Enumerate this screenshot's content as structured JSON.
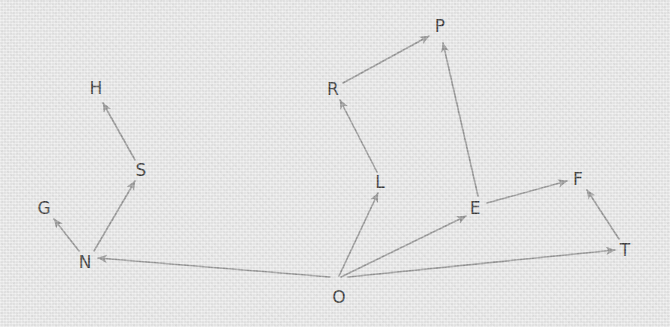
{
  "diagram": {
    "type": "directed-graph",
    "background_color": "#ececec",
    "edge_color": "#8a8a8a",
    "label_color": "#1c1c1c",
    "width": 670,
    "height": 327,
    "nodes": [
      {
        "id": "H",
        "label": "H",
        "x": 96,
        "y": 88
      },
      {
        "id": "S",
        "label": "S",
        "x": 141,
        "y": 170
      },
      {
        "id": "G",
        "label": "G",
        "x": 44,
        "y": 208
      },
      {
        "id": "N",
        "label": "N",
        "x": 85,
        "y": 262
      },
      {
        "id": "P",
        "label": "P",
        "x": 440,
        "y": 26
      },
      {
        "id": "R",
        "label": "R",
        "x": 333,
        "y": 89
      },
      {
        "id": "L",
        "label": "L",
        "x": 380,
        "y": 182
      },
      {
        "id": "E",
        "label": "E",
        "x": 475,
        "y": 208
      },
      {
        "id": "F",
        "label": "F",
        "x": 578,
        "y": 179
      },
      {
        "id": "T",
        "label": "T",
        "x": 625,
        "y": 250
      },
      {
        "id": "O",
        "label": "O",
        "x": 339,
        "y": 297
      }
    ],
    "edges": [
      {
        "from": "S",
        "to": "H",
        "x1": 135,
        "y1": 160,
        "x2": 103,
        "y2": 103
      },
      {
        "from": "N",
        "to": "S",
        "x1": 94,
        "y1": 251,
        "x2": 135,
        "y2": 181
      },
      {
        "from": "N",
        "to": "G",
        "x1": 79,
        "y1": 251,
        "x2": 54,
        "y2": 219
      },
      {
        "from": "O",
        "to": "N",
        "x1": 330,
        "y1": 277,
        "x2": 98,
        "y2": 258
      },
      {
        "from": "O",
        "to": "L",
        "x1": 339,
        "y1": 276,
        "x2": 378,
        "y2": 193
      },
      {
        "from": "O",
        "to": "E",
        "x1": 341,
        "y1": 277,
        "x2": 466,
        "y2": 216
      },
      {
        "from": "O",
        "to": "T",
        "x1": 348,
        "y1": 277,
        "x2": 615,
        "y2": 250
      },
      {
        "from": "L",
        "to": "R",
        "x1": 377,
        "y1": 172,
        "x2": 340,
        "y2": 100
      },
      {
        "from": "R",
        "to": "P",
        "x1": 343,
        "y1": 83,
        "x2": 429,
        "y2": 36
      },
      {
        "from": "E",
        "to": "P",
        "x1": 478,
        "y1": 196,
        "x2": 443,
        "y2": 43
      },
      {
        "from": "E",
        "to": "F",
        "x1": 487,
        "y1": 203,
        "x2": 567,
        "y2": 181
      },
      {
        "from": "T",
        "to": "F",
        "x1": 619,
        "y1": 239,
        "x2": 587,
        "y2": 190
      }
    ]
  }
}
